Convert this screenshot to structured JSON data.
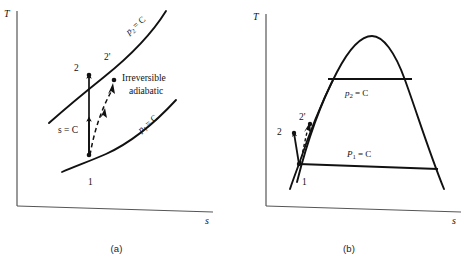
{
  "figure": {
    "background_color": "#ffffff",
    "ink_color": "#111111",
    "axis_color": "#555555"
  },
  "panels": [
    {
      "id": "a",
      "caption": "(a)",
      "description": "Superheated-vapor region T-s diagram with two constant-pressure lines",
      "axes": {
        "y_label": "T",
        "x_label": "s"
      },
      "curves": [
        {
          "name": "p2-isobar",
          "label": "p",
          "label_sub": "2",
          "label_tail": "= C"
        },
        {
          "name": "p1-isobar",
          "label": "p",
          "label_sub": "1",
          "label_tail": "= C"
        }
      ],
      "points": [
        {
          "name": "state-1",
          "label": "1"
        },
        {
          "name": "state-2",
          "label": "2"
        },
        {
          "name": "state-2-prime",
          "label": "2'"
        }
      ],
      "processes": [
        {
          "name": "isentropic-process",
          "label": "s = C",
          "style": "solid-arrow",
          "from": "1",
          "to": "2"
        },
        {
          "name": "irreversible-adiabatic-process",
          "label_line1": "Irreversible",
          "label_line2": "adiabatic",
          "style": "dashed-arrow",
          "from": "1",
          "to": "2'"
        }
      ]
    },
    {
      "id": "b",
      "caption": "(b)",
      "description": "T-s diagram with saturation dome and two constant-pressure lines",
      "axes": {
        "y_label": "T",
        "x_label": "s"
      },
      "curves": [
        {
          "name": "saturation-dome",
          "label": ""
        },
        {
          "name": "p2-isobar",
          "label": "p",
          "label_sub": "2",
          "label_tail": "= C"
        },
        {
          "name": "p1-isobar",
          "label": "P",
          "label_sub": "1",
          "label_tail": "= C"
        }
      ],
      "points": [
        {
          "name": "state-1",
          "label": "1"
        },
        {
          "name": "state-2",
          "label": "2"
        },
        {
          "name": "state-2-prime",
          "label": "2'"
        }
      ],
      "processes": [
        {
          "name": "isentropic-process",
          "label": "",
          "style": "solid-arrow",
          "from": "1",
          "to": "2"
        },
        {
          "name": "irreversible-adiabatic-process",
          "label": "",
          "style": "dashed-arrow",
          "from": "1",
          "to": "2'"
        }
      ]
    }
  ]
}
